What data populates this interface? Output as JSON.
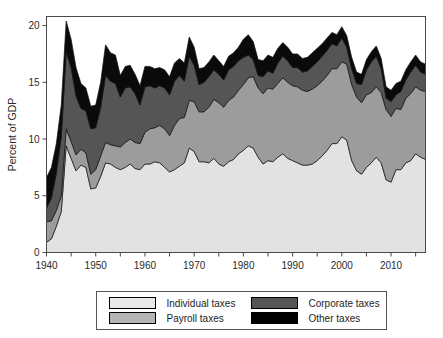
{
  "chart_data": {
    "type": "area",
    "stacked": true,
    "title": "",
    "xlabel": "",
    "ylabel": "Percent of GDP",
    "xlim": [
      1940,
      2017
    ],
    "ylim": [
      0,
      20.8
    ],
    "yticks": [
      0,
      5,
      10,
      15,
      20
    ],
    "ytick_labels": [
      "0",
      "5",
      "10",
      "15",
      "20"
    ],
    "xticks": [
      1940,
      1945,
      1950,
      1955,
      1960,
      1965,
      1970,
      1975,
      1980,
      1985,
      1990,
      1995,
      2000,
      2005,
      2010,
      2015
    ],
    "xtick_labels": [
      "1940",
      "",
      "1950",
      "",
      "1960",
      "",
      "1970",
      "",
      "1980",
      "",
      "1990",
      "",
      "2000",
      "",
      "2010",
      ""
    ],
    "grid": false,
    "legend_position": "below-center",
    "x": [
      1940,
      1941,
      1942,
      1943,
      1944,
      1945,
      1946,
      1947,
      1948,
      1949,
      1950,
      1951,
      1952,
      1953,
      1954,
      1955,
      1956,
      1957,
      1958,
      1959,
      1960,
      1961,
      1962,
      1963,
      1964,
      1965,
      1966,
      1967,
      1968,
      1969,
      1970,
      1971,
      1972,
      1973,
      1974,
      1975,
      1976,
      1977,
      1978,
      1979,
      1980,
      1981,
      1982,
      1983,
      1984,
      1985,
      1986,
      1987,
      1988,
      1989,
      1990,
      1991,
      1992,
      1993,
      1994,
      1995,
      1996,
      1997,
      1998,
      1999,
      2000,
      2001,
      2002,
      2003,
      2004,
      2005,
      2006,
      2007,
      2008,
      2009,
      2010,
      2011,
      2012,
      2013,
      2014,
      2015,
      2016,
      2017
    ],
    "series": [
      {
        "name": "Individual taxes",
        "color": "#e2e2e2",
        "values": [
          0.9,
          1.2,
          2.3,
          3.6,
          9.4,
          8.3,
          7.2,
          7.7,
          7.5,
          5.6,
          5.7,
          6.7,
          7.9,
          7.8,
          7.5,
          7.3,
          7.5,
          7.8,
          7.4,
          7.3,
          7.8,
          7.8,
          8.0,
          7.9,
          7.5,
          7.1,
          7.3,
          7.6,
          7.9,
          9.2,
          8.9,
          8.0,
          8.0,
          7.9,
          8.3,
          7.8,
          7.6,
          8.0,
          8.2,
          8.7,
          9.0,
          9.4,
          9.2,
          8.4,
          7.8,
          8.1,
          8.0,
          8.4,
          8.7,
          8.3,
          8.1,
          7.9,
          7.7,
          7.7,
          7.8,
          8.1,
          8.5,
          9.0,
          9.6,
          9.6,
          10.2,
          9.9,
          8.1,
          7.2,
          6.9,
          7.5,
          7.9,
          8.4,
          7.9,
          6.4,
          6.2,
          7.3,
          7.3,
          7.9,
          8.1,
          8.7,
          8.4,
          8.2
        ]
      },
      {
        "name": "Payroll taxes",
        "color": "#9c9c9c",
        "values": [
          1.8,
          1.6,
          1.4,
          1.4,
          1.5,
          1.5,
          1.4,
          1.4,
          1.3,
          1.3,
          1.6,
          1.8,
          1.8,
          1.7,
          1.9,
          2.0,
          2.2,
          2.2,
          2.3,
          2.3,
          2.8,
          3.1,
          3.0,
          3.3,
          3.4,
          3.2,
          3.9,
          4.2,
          4.0,
          4.2,
          4.4,
          4.4,
          4.4,
          4.9,
          5.2,
          5.4,
          5.2,
          5.4,
          5.5,
          5.6,
          5.8,
          6.0,
          6.3,
          6.1,
          6.2,
          6.4,
          6.4,
          6.5,
          6.7,
          6.7,
          6.6,
          6.7,
          6.6,
          6.5,
          6.6,
          6.6,
          6.6,
          6.6,
          6.6,
          6.6,
          6.6,
          6.7,
          6.7,
          6.5,
          6.3,
          6.4,
          6.2,
          6.2,
          6.2,
          6.2,
          5.8,
          5.4,
          5.3,
          5.7,
          5.9,
          5.9,
          5.9,
          6.0
        ]
      },
      {
        "name": "Corporate taxes",
        "color": "#555555",
        "values": [
          1.2,
          2.0,
          3.3,
          5.2,
          6.8,
          6.5,
          5.2,
          3.6,
          3.7,
          4.0,
          3.7,
          4.3,
          5.9,
          5.6,
          5.5,
          4.4,
          4.8,
          4.6,
          4.3,
          3.4,
          4.0,
          3.8,
          3.5,
          3.5,
          3.6,
          3.6,
          3.9,
          3.8,
          3.2,
          3.9,
          3.2,
          2.4,
          2.6,
          2.7,
          2.6,
          2.5,
          2.4,
          2.7,
          2.7,
          2.6,
          2.4,
          2.0,
          1.5,
          1.1,
          1.5,
          1.5,
          1.4,
          1.8,
          1.9,
          1.9,
          1.6,
          1.7,
          1.6,
          1.8,
          2.0,
          2.1,
          2.2,
          2.2,
          2.2,
          2.0,
          2.1,
          1.5,
          1.4,
          1.2,
          1.6,
          2.2,
          2.7,
          2.7,
          2.1,
          1.0,
          1.3,
          1.2,
          1.6,
          1.6,
          1.9,
          1.9,
          1.6,
          1.5
        ]
      },
      {
        "name": "Other taxes",
        "color": "#0a0a0a",
        "values": [
          2.7,
          2.7,
          2.6,
          2.8,
          2.7,
          2.5,
          2.5,
          2.2,
          2.0,
          2.0,
          2.0,
          2.2,
          2.7,
          2.5,
          2.5,
          1.9,
          1.9,
          1.9,
          1.7,
          1.7,
          1.8,
          1.7,
          1.7,
          1.6,
          1.6,
          1.6,
          1.6,
          1.5,
          1.6,
          1.7,
          1.6,
          1.4,
          1.3,
          1.3,
          1.3,
          1.2,
          1.2,
          1.2,
          1.2,
          1.2,
          1.6,
          1.8,
          1.6,
          1.4,
          1.4,
          1.4,
          1.4,
          1.3,
          1.2,
          1.2,
          1.2,
          1.2,
          1.2,
          1.2,
          1.2,
          1.2,
          1.1,
          1.1,
          1.0,
          1.0,
          1.0,
          1.0,
          1.0,
          1.0,
          0.9,
          0.9,
          0.9,
          0.9,
          0.9,
          1.0,
          1.0,
          1.0,
          0.9,
          0.9,
          0.9,
          0.9,
          0.9,
          0.9
        ]
      }
    ]
  },
  "legend": {
    "entries": [
      {
        "label": "Individual taxes",
        "color": "#e8e8e8"
      },
      {
        "label": "Payroll taxes",
        "color": "#b4b4b4"
      },
      {
        "label": "Corporate taxes",
        "color": "#555555"
      },
      {
        "label": "Other taxes",
        "color": "#000000"
      }
    ]
  }
}
